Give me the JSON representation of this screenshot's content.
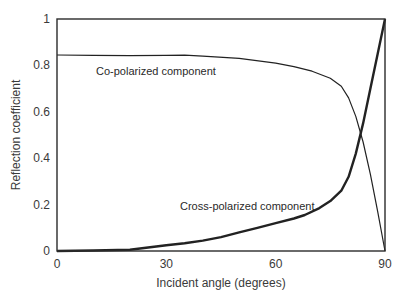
{
  "chart_data": {
    "type": "line",
    "title": "",
    "xlabel": "Incident angle (degrees)",
    "ylabel": "Reflection coefficient",
    "xlim": [
      0,
      90
    ],
    "ylim": [
      0,
      1
    ],
    "xticks": [
      0,
      30,
      60,
      90
    ],
    "xtick_labels": [
      "0",
      "30",
      "60",
      "90"
    ],
    "yticks": [
      0,
      0.2,
      0.4,
      0.6,
      0.8,
      1
    ],
    "ytick_labels": [
      "0",
      "0.2",
      "0.4",
      "0.6",
      "0.8",
      "1"
    ],
    "grid": false,
    "legend": "none (inline annotations)",
    "series": [
      {
        "name": "Co-polarized component",
        "line_width": 1.2,
        "x": [
          0,
          10,
          20,
          30,
          35,
          40,
          50,
          60,
          65,
          70,
          75,
          78,
          80,
          82,
          84,
          86,
          88,
          90
        ],
        "values": [
          0.845,
          0.843,
          0.842,
          0.843,
          0.844,
          0.84,
          0.83,
          0.81,
          0.795,
          0.775,
          0.745,
          0.71,
          0.66,
          0.58,
          0.47,
          0.33,
          0.17,
          0.0
        ]
      },
      {
        "name": "Cross-polarized component",
        "line_width": 2.4,
        "x": [
          0,
          10,
          20,
          25,
          30,
          35,
          40,
          45,
          50,
          55,
          60,
          65,
          68,
          72,
          75,
          78,
          80,
          82,
          84,
          86,
          88,
          90
        ],
        "values": [
          0.0,
          0.002,
          0.005,
          0.015,
          0.025,
          0.033,
          0.045,
          0.06,
          0.08,
          0.1,
          0.12,
          0.14,
          0.155,
          0.185,
          0.215,
          0.26,
          0.32,
          0.42,
          0.55,
          0.7,
          0.85,
          1.0
        ]
      }
    ],
    "annotations": [
      {
        "text": "Co-polarized component",
        "x": 10.5,
        "y": 0.77
      },
      {
        "text": "Cross-polarized component",
        "x": 42,
        "y": 0.155
      }
    ]
  }
}
